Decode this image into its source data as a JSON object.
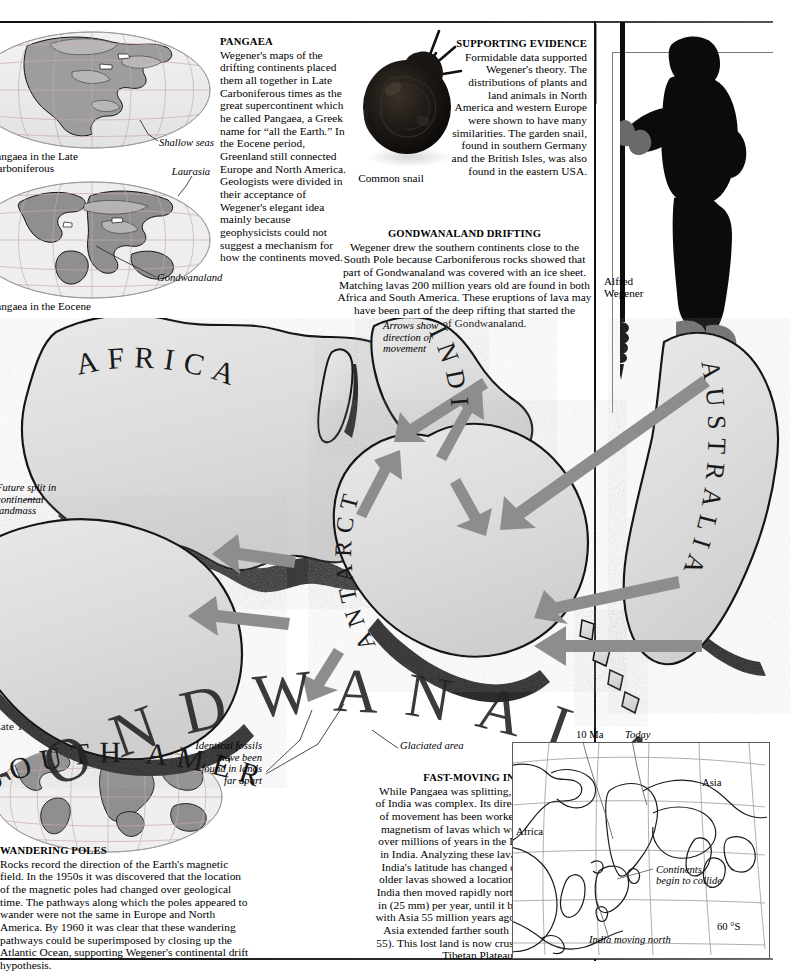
{
  "page": {
    "background": "#ffffff",
    "width": 773,
    "height": 970
  },
  "articles": [
    {
      "id": "pangaea",
      "heading": "PANGAEA",
      "body": "Wegener's maps of the drifting continents placed them all together in Late Carboniferous times as the great supercontinent which he called Pangaea, a Greek name for “all the Earth.” In the Eocene period, Greenland still connected Europe and North America. Geologists were divided in their acceptance of Wegener's elegant idea mainly because geophysicists could not suggest a mechanism for how the continents moved."
    },
    {
      "id": "supporting-evidence",
      "heading": "SUPPORTING EVIDENCE",
      "body": "Formidable data supported Wegener's theory. The distributions of plants and land animals in North America and western Europe were shown to have many similarities. The garden snail, found in southern Germany and the British Isles, was also found in the eastern USA."
    },
    {
      "id": "gondwanaland-drifting",
      "heading": "GONDWANALAND DRIFTING",
      "body": "Wegener drew the southern continents close to the South Pole because Carboniferous rocks showed that part of Gondwanaland was covered with an ice sheet. Matching lavas 200 million years old are found in both Africa and South America. These eruptions of lava may have been part of the deep rifting that started the breakup of Gondwanaland."
    },
    {
      "id": "wandering-poles",
      "heading": "WANDERING POLES",
      "body": "Rocks record the direction of the Earth's magnetic field. In the 1950s it was discovered that the location of the magnetic poles had changed over geological time. The pathways along which the poles appeared to wander were not the same in Europe and North America. By 1960 it was clear that these wandering pathways could be superimposed by closing up the Atlantic Ocean, supporting Wegener's continental drift hypothesis."
    },
    {
      "id": "fast-moving-india",
      "heading": "FAST-MOVING INDIA",
      "body": "While Pangaea was splitting, the movement of India was complex. Its direction and speed of movement has been worked out from the magnetism of lavas which were poured out over millions of years in the Deccan Plateau in India. Analyzing these lavas showed that India's latitude has changed over time. The older lavas showed a location around 60 °S. India then moved rapidly north traveling at 1 in (25 mm) per year, until it began to collide with Asia 55 million years ago, at which time Asia extended farther south than today (p. 55). This lost land is now crushed up into the Tibetan Plateau."
    }
  ],
  "callouts": {
    "shallow_seas": "Shallow seas",
    "laurasia": "Laurasia",
    "gondwanaland": "Gondwanaland",
    "arrows_show": "Arrows show direction of movement",
    "future_split": "Future split in continental landmass",
    "identical_fossils": "Identical fossils have been found in lands far apart",
    "glaciated_area": "Glaciated area"
  },
  "labels": {
    "globe_late_carboniferous": "Pangaea in the Late Carboniferous",
    "globe_eocene": "Pangaea in the Eocene",
    "globe_late_tertiary": "Late Tertiary",
    "common_snail": "Common snail",
    "alfred_wegener": "Alfred Wegener"
  },
  "gondwana_map": {
    "word_arc": "GONDWANALAND",
    "continents": [
      {
        "name": "AFRICA"
      },
      {
        "name": "SOUTH AMERICA"
      },
      {
        "name": "INDIA"
      },
      {
        "name": "ANTARCTICA"
      },
      {
        "name": "AUSTRALIA"
      }
    ],
    "arrow_color": "#8d8d8d"
  },
  "india_inset": {
    "labels": {
      "ten_ma": "10 Ma",
      "today": "Today",
      "asia": "Asia",
      "africa": "Africa",
      "continents_collide": "Continents begin to collide",
      "sixty_south": "60 °S",
      "india_moving_north": "India moving north"
    }
  }
}
